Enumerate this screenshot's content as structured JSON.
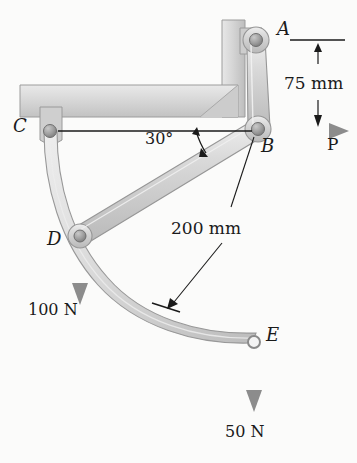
{
  "figure": {
    "background_color": "#fbfbfa",
    "member_fill": "#d2d2d2",
    "member_stroke": "#8a8a8a",
    "frame_fill": "#d8d8d8",
    "pin_fill": "#9a9a9a",
    "arrow_color": "#8c8c8c",
    "line_color": "#1a1a1a"
  },
  "points": {
    "a": {
      "label": "A",
      "x": 256,
      "y": 40,
      "label_x": 277,
      "label_y": 24
    },
    "b": {
      "label": "B",
      "x": 258,
      "y": 129,
      "label_x": 261,
      "label_y": 140
    },
    "c": {
      "label": "C",
      "x": 50,
      "y": 131,
      "label_x": 14,
      "label_y": 118
    },
    "d": {
      "label": "D",
      "x": 80,
      "y": 236,
      "label_x": 48,
      "label_y": 232
    },
    "e": {
      "label": "E",
      "x": 254,
      "y": 342,
      "label_x": 266,
      "label_y": 328
    }
  },
  "dimensions": {
    "vertical_75": {
      "label": "75 mm",
      "value": 75,
      "unit": "mm",
      "label_x": 285,
      "label_y": 82,
      "from_y": 40,
      "to_y": 131,
      "line_x": 318
    },
    "radius_200": {
      "label": "200 mm",
      "value": 200,
      "unit": "mm",
      "label_x": 172,
      "label_y": 228,
      "leader_from_x": 256,
      "leader_from_y": 136,
      "leader_to_x": 168,
      "leader_to_y": 307
    }
  },
  "angle": {
    "label": "30°",
    "value": 30,
    "label_x": 146,
    "label_y": 138
  },
  "loads": {
    "p": {
      "label": "P",
      "label_x": 327,
      "label_y": 140,
      "from_x": 258,
      "from_y": 131,
      "to_x": 348,
      "to_y": 131,
      "direction": "right"
    },
    "load_d": {
      "label": "100 N",
      "value": 100,
      "unit": "N",
      "label_x": 29,
      "label_y": 310,
      "from_x": 80,
      "from_y": 236,
      "to_x": 80,
      "to_y": 300,
      "direction": "down"
    },
    "load_e": {
      "label": "50 N",
      "value": 50,
      "unit": "N",
      "label_x": 226,
      "label_y": 432,
      "from_x": 254,
      "from_y": 342,
      "to_x": 254,
      "to_y": 408,
      "direction": "down"
    }
  },
  "members": {
    "frame_beam": {
      "name": "fixed-horizontal-beam"
    },
    "frame_column": {
      "name": "fixed-vertical-column"
    },
    "link_ab": {
      "name": "link-A-B"
    },
    "link_db": {
      "name": "link-D-B"
    },
    "curved_member_cde": {
      "name": "curved-member-C-D-E"
    }
  }
}
